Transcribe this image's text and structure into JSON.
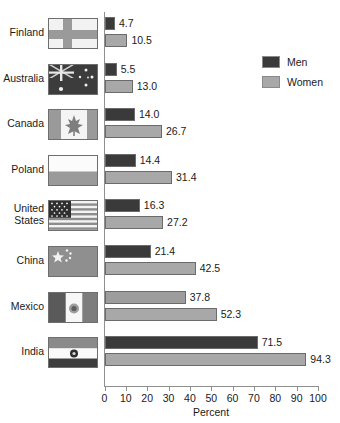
{
  "title_remnant": "",
  "legend": {
    "position": "top-right",
    "entries": [
      {
        "label": "Men",
        "color": "#3a3a3a",
        "name": "men"
      },
      {
        "label": "Women",
        "color": "#a8a8a8",
        "name": "women"
      }
    ]
  },
  "axis": {
    "xlabel": "Percent",
    "ticks": [
      "0",
      "10",
      "20",
      "30",
      "40",
      "50",
      "60",
      "70",
      "80",
      "90",
      "100"
    ]
  },
  "chart_data": {
    "type": "bar",
    "orientation": "horizontal",
    "title": "",
    "xlabel": "Percent",
    "ylabel": "",
    "xlim": [
      0,
      100
    ],
    "xticks": [
      0,
      10,
      20,
      30,
      40,
      50,
      60,
      70,
      80,
      90,
      100
    ],
    "grid": false,
    "legend_position": "top-right",
    "categories": [
      "Finland",
      "Australia",
      "Canada",
      "Poland",
      "United States",
      "China",
      "Mexico",
      "India"
    ],
    "series": [
      {
        "name": "Men",
        "color": "#3a3a3a",
        "values": [
          4.7,
          5.5,
          14.0,
          14.4,
          16.3,
          21.4,
          37.8,
          71.5
        ]
      },
      {
        "name": "Women",
        "color": "#a8a8a8",
        "values": [
          10.5,
          13.0,
          26.7,
          31.4,
          27.2,
          42.5,
          52.3,
          94.3
        ]
      }
    ],
    "data_labels": [
      {
        "category": "Finland",
        "men": "4.7",
        "women": "10.5"
      },
      {
        "category": "Australia",
        "men": "5.5",
        "women": "13.0"
      },
      {
        "category": "Canada",
        "men": "14.0",
        "women": "26.7"
      },
      {
        "category": "Poland",
        "men": "14.4",
        "women": "31.4"
      },
      {
        "category": "United States",
        "men": "16.3",
        "women": "27.2"
      },
      {
        "category": "China",
        "men": "21.4",
        "women": "42.5"
      },
      {
        "category": "Mexico",
        "men": "37.8",
        "women": "52.3"
      },
      {
        "category": "India",
        "men": "71.5",
        "women": "94.3"
      }
    ]
  },
  "rows": [
    {
      "country": "Finland",
      "country_line1": "Finland",
      "country_line2": "",
      "flag": "flag-finland",
      "men": "4.7",
      "women": "10.5",
      "men_value": 4.7,
      "women_value": 10.5
    },
    {
      "country": "Australia",
      "country_line1": "Australia",
      "country_line2": "",
      "flag": "flag-australia",
      "men": "5.5",
      "women": "13.0",
      "men_value": 5.5,
      "women_value": 13.0
    },
    {
      "country": "Canada",
      "country_line1": "Canada",
      "country_line2": "",
      "flag": "flag-canada",
      "men": "14.0",
      "women": "26.7",
      "men_value": 14.0,
      "women_value": 26.7
    },
    {
      "country": "Poland",
      "country_line1": "Poland",
      "country_line2": "",
      "flag": "flag-poland",
      "men": "14.4",
      "women": "31.4",
      "men_value": 14.4,
      "women_value": 31.4
    },
    {
      "country": "United States",
      "country_line1": "United",
      "country_line2": "States",
      "flag": "flag-united-states",
      "men": "16.3",
      "women": "27.2",
      "men_value": 16.3,
      "women_value": 27.2
    },
    {
      "country": "China",
      "country_line1": "China",
      "country_line2": "",
      "flag": "flag-china",
      "men": "21.4",
      "women": "42.5",
      "men_value": 21.4,
      "women_value": 42.5
    },
    {
      "country": "Mexico",
      "country_line1": "Mexico",
      "country_line2": "",
      "flag": "flag-mexico",
      "men": "37.8",
      "women": "52.3",
      "men_value": 37.8,
      "women_value": 52.3
    },
    {
      "country": "India",
      "country_line1": "India",
      "country_line2": "",
      "flag": "flag-india",
      "men": "71.5",
      "women": "94.3",
      "men_value": 71.5,
      "women_value": 94.3
    }
  ]
}
